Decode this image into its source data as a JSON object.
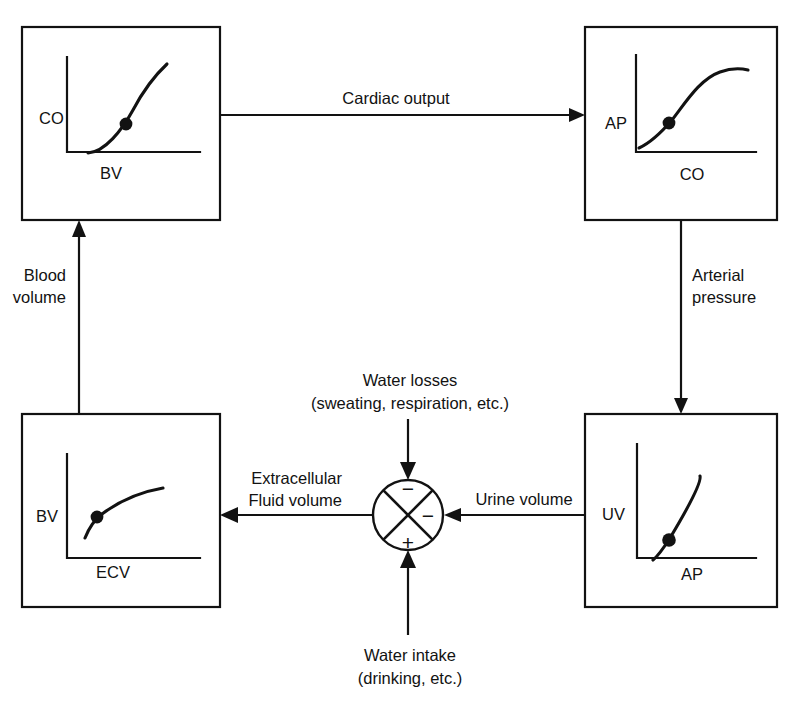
{
  "diagram": {
    "stroke_color": "#121212",
    "background_color": "#ffffff",
    "boxes": [
      {
        "id": "co-bv",
        "name": "box-co-vs-bv",
        "y_axis_label": "CO",
        "x_axis_label": "BV",
        "curve_shape": "convex-increasing"
      },
      {
        "id": "ap-co",
        "name": "box-ap-vs-co",
        "y_axis_label": "AP",
        "x_axis_label": "CO",
        "curve_shape": "sigmoid-increasing"
      },
      {
        "id": "uv-ap",
        "name": "box-uv-vs-ap",
        "y_axis_label": "UV",
        "x_axis_label": "AP",
        "curve_shape": "steep-linear-increasing"
      },
      {
        "id": "bv-ecv",
        "name": "box-bv-vs-ecv",
        "y_axis_label": "BV",
        "x_axis_label": "ECV",
        "curve_shape": "concave-saturating"
      }
    ],
    "connector_labels": {
      "cardiac_output": "Cardiac output",
      "arterial_pressure_line1": "Arterial",
      "arterial_pressure_line2": "pressure",
      "urine_volume": "Urine volume",
      "extracellular_line1": "Extracellular",
      "extracellular_line2": "Fluid volume",
      "blood_volume_line1": "Blood",
      "blood_volume_line2": "volume",
      "water_losses_line1": "Water losses",
      "water_losses_line2": "(sweating, respiration, etc.)",
      "water_intake_line1": "Water intake",
      "water_intake_line2": "(drinking, etc.)"
    },
    "summing_junction": {
      "name": "summing-junction",
      "top_sign": "−",
      "right_sign": "−",
      "bottom_sign": "+",
      "left_sign": ""
    }
  }
}
